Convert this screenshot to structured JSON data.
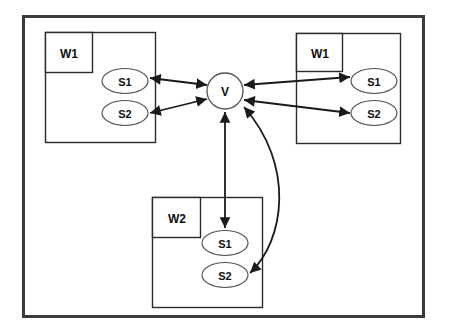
{
  "diagram": {
    "title": "",
    "colors": {
      "frame_stroke": "#3b3b3b",
      "box_stroke": "#2b2b2b",
      "ellipse_stroke": "#555555",
      "arrow_stroke": "#1a1a1a",
      "text": "#111111",
      "background": "#ffffff"
    },
    "frame": {
      "name": "outer-frame",
      "x": 22,
      "y": 15,
      "width": 403,
      "height": 303,
      "stroke_width": 3
    },
    "groups": [
      {
        "id": "left-workspace",
        "label": "W1",
        "outer": {
          "x": 45,
          "y": 32,
          "width": 110,
          "height": 110
        },
        "inner": {
          "x": 45,
          "y": 32,
          "width": 47,
          "height": 40
        },
        "label_pos": {
          "x": 68,
          "y": 54
        },
        "services": [
          {
            "id": "left-s1",
            "label": "S1",
            "cx": 125,
            "cy": 81,
            "rx": 23,
            "ry": 12
          },
          {
            "id": "left-s2",
            "label": "S2",
            "cx": 125,
            "cy": 113,
            "rx": 23,
            "ry": 12
          }
        ]
      },
      {
        "id": "right-workspace",
        "label": "W1",
        "outer": {
          "x": 296,
          "y": 33,
          "width": 104,
          "height": 110
        },
        "inner": {
          "x": 296,
          "y": 33,
          "width": 46,
          "height": 38
        },
        "label_pos": {
          "x": 319,
          "y": 54
        },
        "services": [
          {
            "id": "right-s1",
            "label": "S1",
            "cx": 374,
            "cy": 81,
            "rx": 23,
            "ry": 12
          },
          {
            "id": "right-s2",
            "label": "S2",
            "cx": 374,
            "cy": 113,
            "rx": 23,
            "ry": 12
          }
        ]
      },
      {
        "id": "bottom-workspace",
        "label": "W2",
        "outer": {
          "x": 152,
          "y": 197,
          "width": 110,
          "height": 110
        },
        "inner": {
          "x": 152,
          "y": 197,
          "width": 48,
          "height": 40
        },
        "label_pos": {
          "x": 176,
          "y": 219
        },
        "services": [
          {
            "id": "bottom-s1",
            "label": "S1",
            "cx": 225,
            "cy": 243,
            "rx": 23,
            "ry": 12
          },
          {
            "id": "bottom-s2",
            "label": "S2",
            "cx": 225,
            "cy": 275,
            "rx": 23,
            "ry": 12
          }
        ]
      }
    ],
    "hub": {
      "id": "hub-v",
      "label": "V",
      "cx": 225,
      "cy": 91,
      "r": 18
    },
    "connections": [
      {
        "id": "edge-left-s1-v",
        "from": "left-s1",
        "to": "hub-v",
        "kind": "line",
        "bidirectional": true,
        "x1": 150,
        "y1": 78,
        "x2": 207,
        "y2": 85
      },
      {
        "id": "edge-left-s2-v",
        "from": "left-s2",
        "to": "hub-v",
        "kind": "line",
        "bidirectional": true,
        "x1": 150,
        "y1": 113,
        "x2": 207,
        "y2": 99
      },
      {
        "id": "edge-v-right-s1",
        "from": "hub-v",
        "to": "right-s1",
        "kind": "line",
        "bidirectional": true,
        "x1": 244,
        "y1": 85,
        "x2": 350,
        "y2": 77
      },
      {
        "id": "edge-v-right-s2",
        "from": "hub-v",
        "to": "right-s2",
        "kind": "line",
        "bidirectional": true,
        "x1": 244,
        "y1": 100,
        "x2": 350,
        "y2": 113
      },
      {
        "id": "edge-v-bottom-s1",
        "from": "hub-v",
        "to": "bottom-s1",
        "kind": "line",
        "bidirectional": true,
        "x1": 225,
        "y1": 110,
        "x2": 225,
        "y2": 228
      },
      {
        "id": "edge-v-bottom-s2",
        "from": "hub-v",
        "to": "bottom-s2",
        "kind": "curve",
        "bidirectional": true,
        "x1": 244,
        "y1": 107,
        "cx1": 295,
        "cy1": 165,
        "cx2": 285,
        "cy2": 240,
        "x2": 250,
        "y2": 273
      }
    ]
  }
}
